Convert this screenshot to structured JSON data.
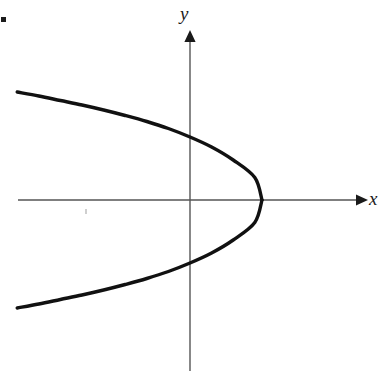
{
  "figure": {
    "kind": "coordinate-plane-graph",
    "background_color": "#ffffff",
    "labels": {
      "y_axis": "y",
      "x_axis": "x"
    },
    "marks": {
      "corner_dot_color": "#1c1c1c",
      "smudge_color": "#cfcfcf"
    }
  },
  "chart_data": {
    "type": "line",
    "title": "",
    "subtitle": "",
    "xlabel": "x",
    "ylabel": "y",
    "grid": false,
    "legend": null,
    "annotations": [],
    "curve_color": "#111111",
    "curve_width": 3.4,
    "axis_color": "#555555",
    "axis_width": 1.4,
    "equation": "x = a - b*y^2",
    "pixel_geometry": {
      "origin": [
        190,
        200
      ],
      "x_axis": {
        "x_start": 18,
        "x_end": 362,
        "y": 200,
        "arrow": "right",
        "arrow_tip_x": 368
      },
      "y_axis": {
        "y_start": 30,
        "y_end": 371,
        "x": 190,
        "arrow": "up",
        "arrow_tip_y": 30
      },
      "vertex": [
        262,
        200
      ],
      "y_intercepts": [
        [
          190,
          150
        ],
        [
          190,
          250
        ]
      ],
      "upper_endpoint": [
        17,
        92
      ],
      "lower_endpoint": [
        17,
        303
      ]
    },
    "axis_units": {
      "pixels_per_unit_x": 72,
      "pixels_per_unit_y": 50
    },
    "xlim": [
      -2.4,
      2.4
    ],
    "ylim": [
      -3.4,
      3.4
    ],
    "x": [
      -2.4,
      -2.1,
      -1.8,
      -1.5,
      -1.2,
      -0.9,
      -0.6,
      -0.3,
      0.0,
      0.3,
      0.6,
      0.9,
      1.0
    ],
    "y_upper": [
      2.16,
      2.08,
      1.99,
      1.9,
      1.8,
      1.69,
      1.57,
      1.43,
      1.26,
      1.06,
      0.8,
      0.45,
      0.0
    ],
    "y_lower": [
      -2.16,
      -2.08,
      -1.99,
      -1.9,
      -1.8,
      -1.69,
      -1.57,
      -1.43,
      -1.26,
      -1.06,
      -0.8,
      -0.45,
      0.0
    ],
    "series": [
      {
        "name": "upper branch",
        "points": [
          [
            -2.4,
            2.16
          ],
          [
            -1.8,
            1.99
          ],
          [
            -1.2,
            1.8
          ],
          [
            -0.6,
            1.57
          ],
          [
            0.0,
            1.26
          ],
          [
            0.6,
            0.8
          ],
          [
            1.0,
            0.0
          ]
        ]
      },
      {
        "name": "lower branch",
        "points": [
          [
            -2.4,
            -2.16
          ],
          [
            -1.8,
            -1.99
          ],
          [
            -1.2,
            -1.8
          ],
          [
            -0.6,
            -1.57
          ],
          [
            0.0,
            -1.26
          ],
          [
            0.6,
            -0.8
          ],
          [
            1.0,
            0.0
          ]
        ]
      }
    ],
    "tick_labels_x": [],
    "tick_labels_y": []
  }
}
